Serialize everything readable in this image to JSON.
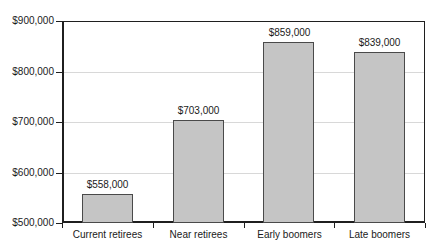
{
  "chart_data": {
    "type": "bar",
    "title": "",
    "xlabel": "",
    "ylabel": "",
    "categories": [
      "Current retirees",
      "Near retirees",
      "Early boomers",
      "Late boomers"
    ],
    "values": [
      558000,
      703000,
      859000,
      839000
    ],
    "value_labels": [
      "$558,000",
      "$703,000",
      "$859,000",
      "$839,000"
    ],
    "ylim": [
      500000,
      900000
    ],
    "y_ticks": [
      500000,
      600000,
      700000,
      800000,
      900000
    ],
    "y_tick_labels": [
      "$500,000",
      "$600,000",
      "$700,000",
      "$800,000",
      "$900,000"
    ],
    "grid": "horizontal",
    "legend": "none",
    "colors": {
      "bar_fill": "#c5c5c5",
      "bar_border": "#4a4a4a",
      "gridline": "#d8d8d8",
      "axis": "#1f1f1f",
      "text": "#1a1a1a",
      "background": "#ffffff"
    }
  }
}
